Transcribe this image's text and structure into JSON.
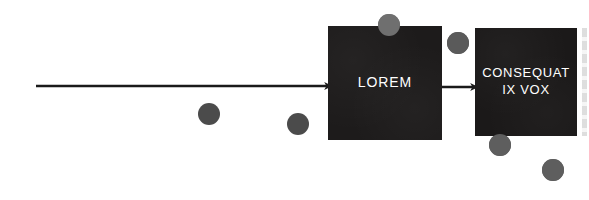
{
  "canvas": {
    "width": 589,
    "height": 200,
    "background_color": "#ffffff"
  },
  "diagram": {
    "type": "flow-diagram",
    "palette": {
      "node_fill": "#1c1a1a",
      "node_text": "#ffffff",
      "arrow_color": "#1a1a1a",
      "circle_light": "#6f6f6f",
      "circle_dark": "#4b4b4b",
      "background": "#ffffff"
    },
    "nodes": [
      {
        "id": "lorem",
        "label": "LOREM",
        "x": 328,
        "y": 26,
        "width": 114,
        "height": 114,
        "fill": "#1c1a1a",
        "text_color": "#ffffff",
        "font_size": 14
      },
      {
        "id": "consequat",
        "label": "CONSEQUAT\nIX VOX",
        "x": 475,
        "y": 28,
        "width": 102,
        "height": 108,
        "fill": "#1c1a1a",
        "text_color": "#ffffff",
        "font_size": 13
      }
    ],
    "arrows": [
      {
        "id": "inbound-arrow",
        "name": "input-arrow",
        "x1": 36,
        "y1": 86,
        "x2": 332,
        "y2": 86,
        "stroke_width": 2.6,
        "color": "#1a1a1a"
      },
      {
        "id": "lorem-to-consequat-arrow",
        "name": "connector-arrow",
        "x1": 442,
        "y1": 87,
        "x2": 478,
        "y2": 87,
        "stroke_width": 2.6,
        "color": "#1a1a1a"
      }
    ],
    "circles": [
      {
        "id": "circle-1",
        "cx": 389,
        "cy": 25,
        "r": 11,
        "fill": "#6f6f6f"
      },
      {
        "id": "circle-2",
        "cx": 458,
        "cy": 43,
        "r": 11,
        "fill": "#5a5a5a"
      },
      {
        "id": "circle-3",
        "cx": 209,
        "cy": 114,
        "r": 11,
        "fill": "#4b4b4b"
      },
      {
        "id": "circle-4",
        "cx": 298,
        "cy": 124,
        "r": 11,
        "fill": "#4b4b4b"
      },
      {
        "id": "circle-5",
        "cx": 500,
        "cy": 145,
        "r": 11,
        "fill": "#5e5e5e"
      },
      {
        "id": "circle-6",
        "cx": 553,
        "cy": 170,
        "r": 11,
        "fill": "#5e5e5e"
      }
    ],
    "edge_artifact": {
      "present": true,
      "description": "cropped-edge-strip"
    }
  }
}
